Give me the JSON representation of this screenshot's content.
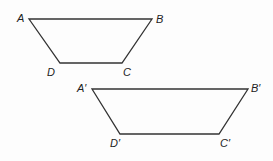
{
  "figure": {
    "stroke_color": "#333333",
    "shapes": [
      {
        "name": "trapezoid-ABCD",
        "points": [
          [
            29,
            19
          ],
          [
            152,
            19
          ],
          [
            122,
            63
          ],
          [
            60,
            63
          ]
        ],
        "labels": [
          {
            "text": "A",
            "x": 17,
            "y": 13
          },
          {
            "text": "B",
            "x": 156,
            "y": 14
          },
          {
            "text": "D",
            "x": 47,
            "y": 67
          },
          {
            "text": "C",
            "x": 123,
            "y": 67
          }
        ]
      },
      {
        "name": "trapezoid-A'B'C'D'",
        "points": [
          [
            92,
            89
          ],
          [
            248,
            89
          ],
          [
            219,
            134
          ],
          [
            120,
            134
          ]
        ],
        "labels": [
          {
            "text": "A′",
            "x": 77,
            "y": 83
          },
          {
            "text": "B′",
            "x": 251,
            "y": 83
          },
          {
            "text": "D′",
            "x": 110,
            "y": 138
          },
          {
            "text": "C′",
            "x": 220,
            "y": 138
          }
        ]
      }
    ]
  }
}
